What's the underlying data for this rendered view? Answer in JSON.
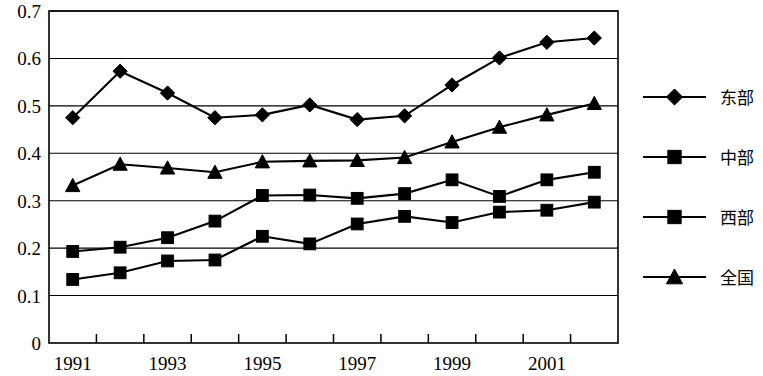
{
  "chart_data": {
    "type": "line",
    "title": "",
    "subtitle": "",
    "xlabel": "",
    "ylabel": "",
    "x": [
      1991,
      1992,
      1993,
      1994,
      1995,
      1996,
      1997,
      1998,
      1999,
      2000,
      2001,
      2002
    ],
    "categories": [
      "1991",
      "1992",
      "1993",
      "1994",
      "1995",
      "1996",
      "1997",
      "1998",
      "1999",
      "2000",
      "2001",
      "2002"
    ],
    "xtick_labels": [
      "1991",
      "1993",
      "1995",
      "1997",
      "1999",
      "2001"
    ],
    "xtick_values": [
      1991,
      1993,
      1995,
      1997,
      1999,
      2001
    ],
    "ytick_labels": [
      "0",
      "0.1",
      "0.2",
      "0.3",
      "0.4",
      "0.5",
      "0.6",
      "0.7"
    ],
    "ytick_values": [
      0,
      0.1,
      0.2,
      0.3,
      0.4,
      0.5,
      0.6,
      0.7
    ],
    "ylim": [
      0,
      0.7
    ],
    "xlim": [
      1990.5,
      2002.5
    ],
    "grid": true,
    "grid_axis": "y",
    "legend_position": "right",
    "line_color": "#000000",
    "series": [
      {
        "name": "东部",
        "marker": "diamond",
        "values": [
          0.475,
          0.573,
          0.527,
          0.475,
          0.481,
          0.502,
          0.471,
          0.479,
          0.544,
          0.601,
          0.634,
          0.643
        ]
      },
      {
        "name": "中部",
        "marker": "square",
        "values": [
          0.193,
          0.202,
          0.222,
          0.257,
          0.311,
          0.312,
          0.305,
          0.315,
          0.344,
          0.309,
          0.344,
          0.36
        ]
      },
      {
        "name": "西部",
        "marker": "square",
        "values": [
          0.134,
          0.148,
          0.173,
          0.175,
          0.225,
          0.209,
          0.251,
          0.267,
          0.254,
          0.276,
          0.28,
          0.297
        ]
      },
      {
        "name": "全国",
        "marker": "triangle",
        "values": [
          0.332,
          0.377,
          0.369,
          0.36,
          0.382,
          0.384,
          0.385,
          0.391,
          0.424,
          0.455,
          0.481,
          0.505
        ]
      }
    ]
  },
  "legend": {
    "items": [
      {
        "label": "东部",
        "marker": "diamond"
      },
      {
        "label": "中部",
        "marker": "square"
      },
      {
        "label": "西部",
        "marker": "square"
      },
      {
        "label": "全国",
        "marker": "triangle"
      }
    ]
  }
}
